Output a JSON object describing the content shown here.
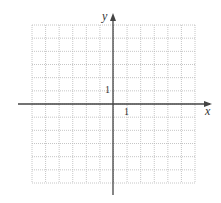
{
  "diagram": {
    "type": "coordinate-grid",
    "grid": {
      "cols": 12,
      "rows": 12,
      "x_range": [
        -6,
        6
      ],
      "y_range": [
        -6,
        6
      ],
      "line_style": "dotted",
      "line_color": "#b8b8b8"
    },
    "axes": {
      "color": "#444444",
      "x_label": "x",
      "y_label": "y"
    },
    "tick_labels": {
      "x_unit": "1",
      "y_unit": "1"
    }
  }
}
